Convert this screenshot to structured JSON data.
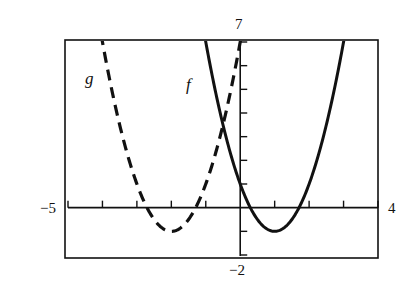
{
  "chart_data": {
    "type": "line",
    "title": "",
    "xlabel": "",
    "ylabel": "",
    "xlim": [
      -5,
      4
    ],
    "ylim": [
      -2,
      7
    ],
    "grid": false,
    "x_tick_step": 1,
    "y_tick_step": 1,
    "axis_labels": {
      "x_min": "−5",
      "x_max": "4",
      "y_max": "7",
      "y_min": "−2"
    },
    "series": [
      {
        "name": "f",
        "style": "solid",
        "formula": "2(x-1)^2 - 1",
        "vertex": [
          1,
          -1
        ],
        "x": [
          -0.9,
          -0.5,
          0,
          0.5,
          1,
          1.5,
          2,
          2.5,
          3
        ],
        "y": [
          6.22,
          3.5,
          1,
          -0.5,
          -1,
          -0.5,
          1,
          3.5,
          7
        ]
      },
      {
        "name": "g",
        "style": "dashed",
        "formula": "2(x+2)^2 - 1",
        "vertex": [
          -2,
          -1
        ],
        "x": [
          -4,
          -3.5,
          -3,
          -2.5,
          -2,
          -1.5,
          -1,
          -0.5,
          0
        ],
        "y": [
          7,
          3.5,
          1,
          -0.5,
          -1,
          -0.5,
          1,
          3.5,
          7
        ]
      }
    ],
    "annotations": [
      {
        "text": "g",
        "near": "left branch of dashed curve"
      },
      {
        "text": "f",
        "near": "left branch of solid curve"
      }
    ]
  },
  "labels": {
    "f": "f",
    "g": "g",
    "x_min": "−5",
    "x_max": "4",
    "y_max": "7",
    "y_min": "−2"
  },
  "colors": {
    "ink": "#111111",
    "background": "#ffffff"
  }
}
